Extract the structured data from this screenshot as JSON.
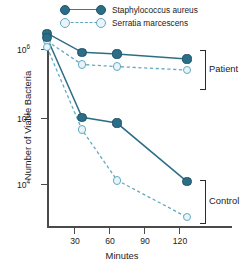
{
  "chart_data": {
    "type": "line",
    "title": "",
    "xlabel": "Minutes",
    "ylabel": "Number of Viable Bacteria",
    "x": [
      0,
      30,
      60,
      120
    ],
    "xticks": [
      30,
      60,
      90,
      120
    ],
    "xlim": [
      0,
      135
    ],
    "yscale": "log",
    "ylim": [
      2000,
      2500000
    ],
    "yticks": [
      10000,
      100000,
      1000000
    ],
    "ytick_labels": [
      "10⁴",
      "10⁵",
      "10⁶"
    ],
    "grid": false,
    "legend_position": "top",
    "annotations": [
      "Patient",
      "Control"
    ],
    "series": [
      {
        "name": "Staphylococcus aureus",
        "group": "Patient",
        "marker": "filled-circle",
        "linestyle": "solid",
        "color": "#2d6e87",
        "x": [
          0,
          30,
          60,
          120
        ],
        "values": [
          1700000,
          880000,
          830000,
          700000
        ]
      },
      {
        "name": "Serratia marcescens",
        "group": "Patient",
        "marker": "open-circle",
        "linestyle": "dashed",
        "color": "#63a9c0",
        "x": [
          0,
          30,
          60,
          120
        ],
        "values": [
          1300000,
          580000,
          540000,
          480000
        ]
      },
      {
        "name": "Staphylococcus aureus",
        "group": "Control",
        "marker": "filled-circle",
        "linestyle": "solid",
        "color": "#2d6e87",
        "x": [
          0,
          30,
          60,
          120
        ],
        "values": [
          1450000,
          95000,
          78000,
          10500
        ]
      },
      {
        "name": "Serratia marcescens",
        "group": "Control",
        "marker": "open-circle",
        "linestyle": "dashed",
        "color": "#63a9c0",
        "x": [
          0,
          30,
          60,
          120
        ],
        "values": [
          1050000,
          62000,
          11000,
          3100
        ]
      }
    ]
  },
  "legend": {
    "entries": [
      {
        "label": "Staphylococcus aureus"
      },
      {
        "label": "Serratia marcescens"
      }
    ]
  },
  "axes": {
    "ylabel": "Number of Viable Bacteria",
    "xlabel": "Minutes",
    "ytick_base": "10",
    "ytick_exponents": [
      "6",
      "5",
      "4"
    ],
    "xtick_labels": [
      "30",
      "60",
      "90",
      "120"
    ]
  },
  "brackets": {
    "patient": "Patient",
    "control": "Control"
  },
  "colors": {
    "dark_teal": "#2d6e87",
    "light_teal": "#63a9c0",
    "axis": "#4a4a4a",
    "text": "#1b1b1b"
  }
}
